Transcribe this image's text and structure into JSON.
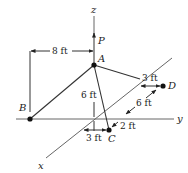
{
  "figure": {
    "axes": {
      "x_label": "x",
      "y_label": "y",
      "z_label": "z"
    },
    "points": {
      "A": "A",
      "B": "B",
      "C": "C",
      "D": "D"
    },
    "force": {
      "label": "P",
      "direction": "up"
    },
    "dimensions": {
      "AB_horizontal": "8 ft",
      "A_height": "6 ft",
      "D_offset_y": "3 ft",
      "CD_along_x": "6 ft",
      "C_offset_x": "2 ft",
      "C_offset_y": "3 ft"
    },
    "colors": {
      "line": "#333333",
      "axis": "#666666",
      "background": "#ffffff"
    }
  }
}
